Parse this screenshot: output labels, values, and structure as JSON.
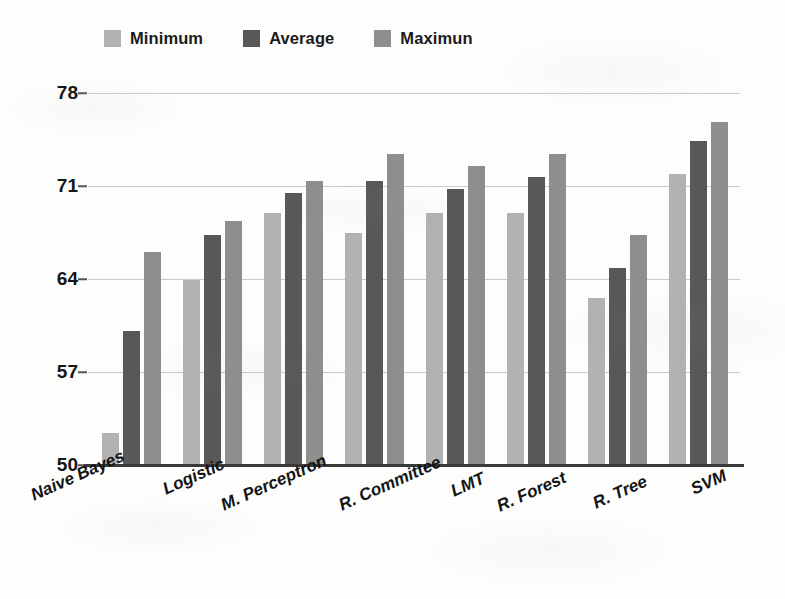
{
  "chart_data": {
    "type": "bar",
    "title": "",
    "xlabel": "",
    "ylabel": "",
    "ylim": [
      50,
      78
    ],
    "yticks": [
      50,
      57,
      64,
      71,
      78
    ],
    "grid": true,
    "legend_position": "top-left",
    "categories": [
      "Naive Bayes",
      "Logistic",
      "M. Perceptron",
      "R. Committee",
      "LMT",
      "R. Forest",
      "R. Tree",
      "SVM"
    ],
    "series": [
      {
        "name": "Minimum",
        "color": "#b2b2b2",
        "values": [
          52.4,
          63.9,
          69.0,
          67.5,
          69.0,
          69.0,
          62.6,
          71.9
        ]
      },
      {
        "name": "Average",
        "color": "#585858",
        "values": [
          60.1,
          67.3,
          70.5,
          71.4,
          70.8,
          71.7,
          64.8,
          74.4
        ]
      },
      {
        "name": "Maximun",
        "color": "#8e8e8e",
        "values": [
          66.0,
          68.4,
          71.4,
          73.4,
          72.5,
          73.4,
          67.3,
          75.8
        ]
      }
    ]
  },
  "legend": {
    "items": [
      {
        "label": "Minimum",
        "color": "#b2b2b2"
      },
      {
        "label": "Average",
        "color": "#585858"
      },
      {
        "label": "Maximun",
        "color": "#8e8e8e"
      }
    ]
  },
  "axis": {
    "y_tick_labels": [
      "78",
      "71",
      "64",
      "57",
      "50"
    ]
  }
}
